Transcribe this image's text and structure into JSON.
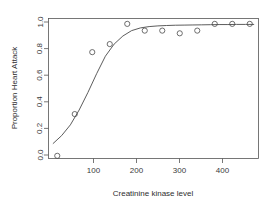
{
  "chart_data": {
    "type": "scatter",
    "title": "",
    "xlabel": "Creatinine kinase level",
    "ylabel": "Proportion Heart Attack",
    "xlim": [
      0,
      480
    ],
    "ylim": [
      0,
      1.04
    ],
    "grid": false,
    "legend": null,
    "xticks": [
      100,
      200,
      300,
      400
    ],
    "xtick_labels": [
      "100",
      "200",
      "300",
      "400"
    ],
    "yticks": [
      0.0,
      0.2,
      0.4,
      0.6,
      0.8,
      1.0
    ],
    "ytick_labels": [
      "0.0",
      "0.2",
      "0.4",
      "0.6",
      "0.8",
      "1.0"
    ],
    "x": [
      20,
      60,
      100,
      140,
      180,
      220,
      260,
      300,
      340,
      380,
      420,
      460
    ],
    "y": [
      0.02,
      0.33,
      0.79,
      0.85,
      1.0,
      0.95,
      0.95,
      0.93,
      0.95,
      1.0,
      1.0,
      1.0
    ],
    "points": [
      {
        "x": 20,
        "y": 0.02
      },
      {
        "x": 60,
        "y": 0.33
      },
      {
        "x": 100,
        "y": 0.79
      },
      {
        "x": 140,
        "y": 0.85
      },
      {
        "x": 180,
        "y": 1.0
      },
      {
        "x": 220,
        "y": 0.95
      },
      {
        "x": 260,
        "y": 0.95
      },
      {
        "x": 300,
        "y": 0.93
      },
      {
        "x": 340,
        "y": 0.95
      },
      {
        "x": 380,
        "y": 1.0
      },
      {
        "x": 420,
        "y": 1.0
      },
      {
        "x": 460,
        "y": 1.0
      }
    ],
    "series": [
      {
        "name": "observed proportion",
        "type": "scatter",
        "marker": "open-circle",
        "color": "#4a4a4a",
        "x": [
          20,
          60,
          100,
          140,
          180,
          220,
          260,
          300,
          340,
          380,
          420,
          460
        ],
        "values": [
          0.02,
          0.33,
          0.79,
          0.85,
          1.0,
          0.95,
          0.95,
          0.93,
          0.95,
          1.0,
          1.0,
          1.0
        ]
      },
      {
        "name": "fitted logistic curve",
        "type": "line",
        "color": "#4a4a4a",
        "x": [
          10,
          30,
          50,
          70,
          90,
          110,
          130,
          150,
          170,
          190,
          210,
          230,
          250,
          270,
          290,
          310,
          330,
          350,
          370,
          390,
          410,
          430,
          450,
          470
        ],
        "values": [
          0.11,
          0.17,
          0.25,
          0.36,
          0.49,
          0.63,
          0.76,
          0.85,
          0.91,
          0.95,
          0.97,
          0.98,
          0.985,
          0.988,
          0.99,
          0.991,
          0.992,
          0.993,
          0.994,
          0.995,
          0.995,
          0.996,
          0.996,
          0.996
        ]
      }
    ]
  }
}
